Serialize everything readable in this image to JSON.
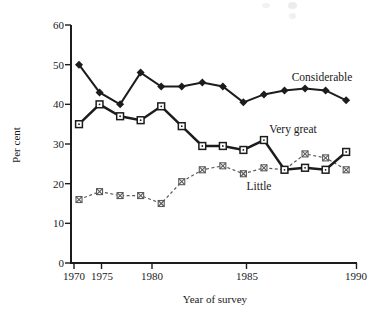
{
  "figure": {
    "colors": {
      "background": "#ffffff",
      "ink": "#1c1c1c",
      "muted_line": "#5a5a5a"
    }
  },
  "chart_data": {
    "type": "line",
    "title": "",
    "xlabel": "Year of survey",
    "ylabel": "Per cent",
    "xlim": [
      1970,
      1990
    ],
    "ylim": [
      0,
      60
    ],
    "grid": false,
    "legend_position": "inline-labels",
    "y_ticks": [
      0,
      10,
      20,
      30,
      40,
      50,
      60
    ],
    "x_tick_labels": [
      "1970",
      "1975",
      "1980",
      "1985",
      "1990"
    ],
    "x": [
      1973,
      1975,
      1977,
      1979,
      1981,
      1982,
      1983,
      1984,
      1985,
      1986,
      1987,
      1988,
      1989,
      1990
    ],
    "series": [
      {
        "name": "Considerable",
        "marker": "filled-diamond",
        "line_style": "solid",
        "values": [
          50,
          43,
          40,
          48,
          44.5,
          44.5,
          45.5,
          44.5,
          40.5,
          42.5,
          43.5,
          44,
          43.5,
          41
        ]
      },
      {
        "name": "Very great",
        "marker": "open-square",
        "line_style": "solid-thick",
        "values": [
          35,
          40,
          37,
          36,
          39.5,
          34.5,
          29.5,
          29.5,
          28.5,
          31,
          23.5,
          24,
          23.5,
          28
        ]
      },
      {
        "name": "Little",
        "marker": "crossed-square",
        "line_style": "dashed",
        "values": [
          16,
          18,
          17,
          17,
          15,
          20.5,
          23.5,
          24.5,
          22.5,
          24,
          23.5,
          27.5,
          26.5,
          23.5
        ]
      }
    ]
  }
}
